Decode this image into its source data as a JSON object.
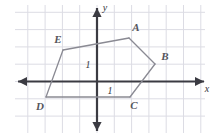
{
  "figure": {
    "name": "coordinate-plane-pentagon",
    "width": 220,
    "height": 139,
    "background_color": "#ffffff",
    "grid": {
      "color": "#dcdce4",
      "spacing_px": 17.3,
      "left": 15,
      "top": 5,
      "right": 205,
      "bottom": 133,
      "visible": true
    },
    "axes": {
      "color": "#3b3b42",
      "origin_x": 97,
      "origin_y": 81.5,
      "x_axis_label": "x",
      "y_axis_label": "y",
      "x_axis_label_x": 207,
      "x_axis_label_y": 92,
      "y_axis_label_x": 105,
      "y_axis_label_y": 11,
      "arrowheads": "double"
    },
    "unit_ticks": [
      {
        "label": "1",
        "axis": "y",
        "x": 88,
        "y": 68
      },
      {
        "label": "1",
        "axis": "x",
        "x": 110,
        "y": 94
      }
    ]
  },
  "chart_data": {
    "type": "scatter",
    "title": "",
    "xlabel": "x",
    "ylabel": "y",
    "grid": true,
    "legend": false,
    "shape": "pentagon",
    "unit_label": "1",
    "xlim": [
      -4.7,
      6.2
    ],
    "ylim": [
      -3.0,
      4.4
    ],
    "vertices": [
      {
        "label": "A",
        "px": 129,
        "py": 38,
        "x": 1.9,
        "y": 2.5,
        "label_px": 136,
        "label_py": 31
      },
      {
        "label": "B",
        "px": 155,
        "py": 64,
        "x": 3.4,
        "y": 1.0,
        "label_px": 165,
        "label_py": 60
      },
      {
        "label": "C",
        "px": 130,
        "py": 97,
        "x": 1.9,
        "y": -0.9,
        "label_px": 134,
        "label_py": 109
      },
      {
        "label": "D",
        "px": 46,
        "py": 97,
        "x": -2.9,
        "y": -0.9,
        "label_px": 40,
        "label_py": 110
      },
      {
        "label": "E",
        "px": 63,
        "py": 50,
        "x": -2.0,
        "y": 1.8,
        "label_px": 58,
        "label_py": 43
      }
    ],
    "edges": [
      [
        "A",
        "B"
      ],
      [
        "B",
        "C"
      ],
      [
        "C",
        "D"
      ],
      [
        "D",
        "E"
      ],
      [
        "E",
        "A"
      ]
    ],
    "shape_stroke_color": "#8a8a93",
    "vertex_label_color": "#55555c"
  }
}
